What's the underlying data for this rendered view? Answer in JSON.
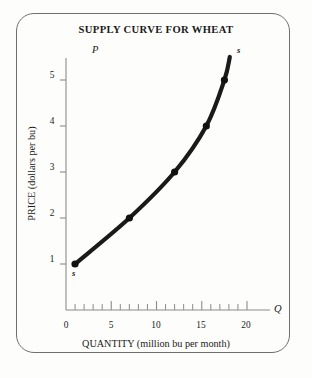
{
  "figure": {
    "title": "SUPPLY CURVE FOR WHEAT",
    "border_color": "#6f6f6f",
    "background_color": "#fdfdfb",
    "curve_color": "#1a1a1a"
  },
  "axes": {
    "x_axis_symbol": "Q",
    "y_axis_symbol": "P",
    "xlabel": "QUANTITY (million bu per month)",
    "ylabel": "PRICE (dollars per bu)",
    "x_ticks": [
      "0",
      "5",
      "10",
      "15",
      "20"
    ],
    "y_ticks": [
      "1",
      "2",
      "3",
      "4",
      "5"
    ]
  },
  "labels": {
    "curve_start_tag": "s",
    "curve_end_tag": "s"
  },
  "chart_data": {
    "type": "line",
    "title": "SUPPLY CURVE FOR WHEAT",
    "xlabel": "QUANTITY (million bu per month)",
    "ylabel": "PRICE (dollars per bu)",
    "xlim": [
      0,
      22
    ],
    "ylim": [
      0,
      5.6
    ],
    "grid": false,
    "legend": null,
    "x_ticks": [
      0,
      5,
      10,
      15,
      20
    ],
    "y_ticks": [
      1,
      2,
      3,
      4,
      5
    ],
    "x_minor_tick_step": 1,
    "series": [
      {
        "name": "S",
        "marker": "filled-circle",
        "line_style": "solid-thick",
        "x": [
          1,
          7,
          12,
          15.5,
          17.5
        ],
        "y": [
          1,
          2,
          3,
          4,
          5
        ],
        "points": [
          {
            "quantity": 1,
            "price": 1
          },
          {
            "quantity": 7,
            "price": 2
          },
          {
            "quantity": 12,
            "price": 3
          },
          {
            "quantity": 15.5,
            "price": 4
          },
          {
            "quantity": 17.5,
            "price": 5
          }
        ],
        "curve_extends_to": {
          "quantity": 18.1,
          "price": 5.5
        },
        "endpoint_labels": {
          "lower": "s",
          "upper": "s"
        }
      }
    ]
  }
}
